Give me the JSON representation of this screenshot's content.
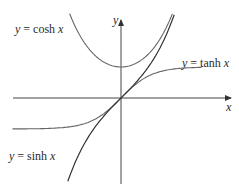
{
  "figure": {
    "axes": {
      "x_label": "x",
      "y_label": "y"
    },
    "curves": [
      {
        "id": "cosh",
        "label_var": "y",
        "label_eq": " = cosh ",
        "label_arg": "x",
        "color": "#555555"
      },
      {
        "id": "tanh",
        "label_var": "y",
        "label_eq": " = tanh ",
        "label_arg": "x",
        "color": "#555555"
      },
      {
        "id": "sinh",
        "label_var": "y",
        "label_eq": " = sinh ",
        "label_arg": "x",
        "color": "#333333"
      }
    ]
  },
  "chart_data": {
    "type": "line",
    "title": "",
    "xlabel": "x",
    "ylabel": "y",
    "grid": false,
    "series": [
      {
        "name": "y = cosh x",
        "function": "cosh(x)",
        "x_range": [
          -2.0,
          2.1
        ],
        "min_point": [
          0,
          1
        ]
      },
      {
        "name": "y = sinh x",
        "function": "sinh(x)",
        "x_range": [
          -2.1,
          2.1
        ],
        "passes_through": [
          0,
          0
        ]
      },
      {
        "name": "y = tanh x",
        "function": "tanh(x)",
        "x_range": [
          -3.5,
          2.6
        ],
        "asymptotes": [
          -1,
          1
        ]
      }
    ]
  }
}
